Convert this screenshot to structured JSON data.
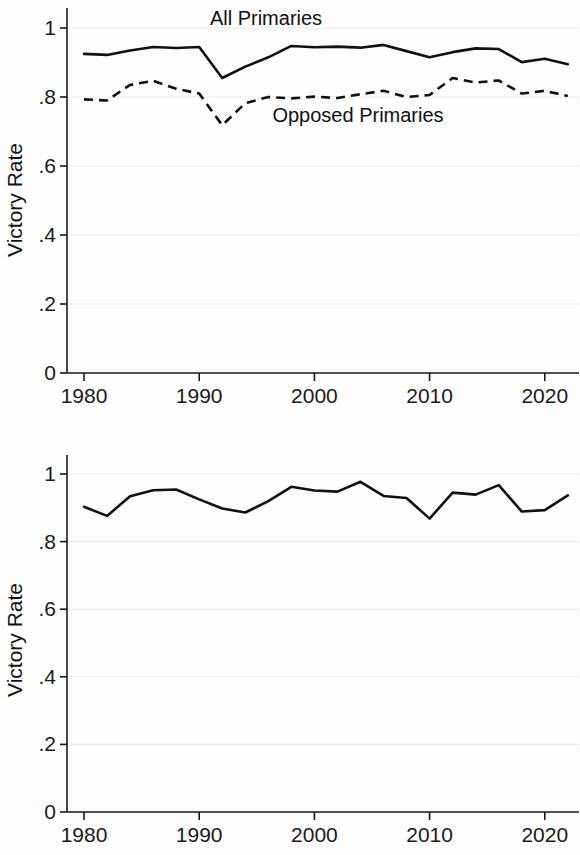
{
  "figure": {
    "background_color": "#fdfdfd",
    "line_color": "#111111",
    "grid_color": "#ececec",
    "axis_color": "#1a1a1a"
  },
  "chart_data": [
    {
      "type": "line",
      "panel": "top",
      "title": "",
      "xlabel": "",
      "ylabel": "Victory Rate",
      "xlim": [
        1979,
        1982.5
      ],
      "ylim": [
        0,
        1.05
      ],
      "grid": true,
      "legend_position": "inline-annotation",
      "ytick_labels": [
        "0",
        ".2",
        ".4",
        ".6",
        ".8",
        "1"
      ],
      "ytick_values": [
        0,
        0.2,
        0.4,
        0.6,
        0.8,
        1
      ],
      "xtick_labels": [
        "1980",
        "1990",
        "2000",
        "2010",
        "2020"
      ],
      "xtick_values": [
        1980,
        1990,
        2000,
        2010,
        2020
      ],
      "x": [
        1980,
        1982,
        1984,
        1986,
        1988,
        1990,
        1992,
        1994,
        1996,
        1998,
        2000,
        2002,
        2004,
        2006,
        2008,
        2010,
        2012,
        2014,
        2016,
        2018,
        2020,
        2022
      ],
      "series": [
        {
          "name": "All Primaries",
          "style": "solid",
          "annotation": "All Primaries",
          "annotation_x": 1995.5,
          "annotation_y": 1.02,
          "values": [
            0.925,
            0.922,
            0.935,
            0.945,
            0.942,
            0.945,
            0.855,
            0.888,
            0.915,
            0.948,
            0.944,
            0.946,
            0.943,
            0.951,
            0.933,
            0.915,
            0.93,
            0.941,
            0.939,
            0.901,
            0.911,
            0.895
          ]
        },
        {
          "name": "Opposed Primaries",
          "style": "dashed",
          "annotation": "Opposed Primaries",
          "annotation_x": 2002.5,
          "annotation_y": 0.755,
          "values": [
            0.793,
            0.79,
            0.835,
            0.847,
            0.824,
            0.81,
            0.718,
            0.782,
            0.8,
            0.796,
            0.801,
            0.797,
            0.808,
            0.818,
            0.8,
            0.806,
            0.855,
            0.842,
            0.848,
            0.81,
            0.818,
            0.803
          ]
        }
      ]
    },
    {
      "type": "line",
      "panel": "bottom",
      "title": "",
      "xlabel": "",
      "ylabel": "Victory Rate",
      "xlim": [
        1979,
        1982.5
      ],
      "ylim": [
        0,
        1.05
      ],
      "grid": true,
      "legend_position": "none",
      "ytick_labels": [
        "0",
        ".2",
        ".4",
        ".6",
        ".8",
        "1"
      ],
      "ytick_values": [
        0,
        0.2,
        0.4,
        0.6,
        0.8,
        1
      ],
      "xtick_labels": [
        "1980",
        "1990",
        "2000",
        "2010",
        "2020"
      ],
      "xtick_values": [
        1980,
        1990,
        2000,
        2010,
        2020
      ],
      "x": [
        1980,
        1982,
        1984,
        1986,
        1988,
        1990,
        1992,
        1994,
        1996,
        1998,
        2000,
        2002,
        2004,
        2006,
        2008,
        2010,
        2012,
        2014,
        2016,
        2018,
        2020,
        2022
      ],
      "series": [
        {
          "name": "Victory Rate",
          "style": "solid",
          "annotation": "",
          "values": [
            0.903,
            0.876,
            0.934,
            0.952,
            0.954,
            0.925,
            0.898,
            0.886,
            0.92,
            0.962,
            0.951,
            0.948,
            0.977,
            0.935,
            0.929,
            0.868,
            0.945,
            0.939,
            0.967,
            0.889,
            0.893,
            0.937
          ]
        }
      ]
    }
  ]
}
